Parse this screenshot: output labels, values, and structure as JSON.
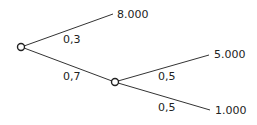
{
  "diagram": {
    "type": "probability-tree",
    "colors": {
      "line": "#333333",
      "text": "#222222",
      "node_fill": "#ffffff"
    },
    "nodes": [
      {
        "id": "root",
        "x": 21,
        "y": 47
      },
      {
        "id": "chance",
        "x": 115,
        "y": 82
      }
    ],
    "branches": [
      {
        "from": "root",
        "probability": "0,3",
        "outcome": "8.000"
      },
      {
        "from": "root",
        "probability": "0,7",
        "to": "chance"
      },
      {
        "from": "chance",
        "probability": "0,5",
        "outcome": "5.000"
      },
      {
        "from": "chance",
        "probability": "0,5",
        "outcome": "1.000"
      }
    ]
  }
}
